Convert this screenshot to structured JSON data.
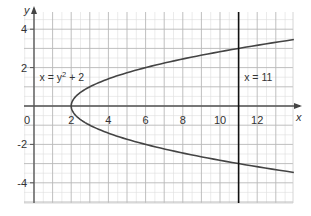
{
  "chart_data": {
    "type": "line",
    "title": "",
    "xlabel": "x",
    "ylabel": "y",
    "xlim": [
      -1,
      13.5
    ],
    "ylim": [
      -5,
      4.8
    ],
    "grid": true,
    "grid_minor_step": 0.5,
    "grid_major_step": 1,
    "x_ticks": [
      0,
      2,
      4,
      6,
      8,
      10,
      12
    ],
    "x_tick_labels": [
      "0",
      "2",
      "4",
      "6",
      "8",
      "10",
      "12"
    ],
    "y_ticks": [
      4,
      2,
      -2,
      -4
    ],
    "y_tick_labels": [
      "4",
      "2",
      "-2",
      "-4"
    ],
    "series": [
      {
        "name": "x = y² + 2",
        "equation": "x = y^2 + 2",
        "kind": "parametric-parabola",
        "y_range": [
          -3.46,
          3.46
        ],
        "points": [
          {
            "x": 14.0,
            "y": -3.46
          },
          {
            "x": 11.0,
            "y": -3.0
          },
          {
            "x": 8.25,
            "y": -2.5
          },
          {
            "x": 6.0,
            "y": -2.0
          },
          {
            "x": 4.25,
            "y": -1.5
          },
          {
            "x": 3.0,
            "y": -1.0
          },
          {
            "x": 2.25,
            "y": -0.5
          },
          {
            "x": 2.0,
            "y": 0.0
          },
          {
            "x": 2.25,
            "y": 0.5
          },
          {
            "x": 3.0,
            "y": 1.0
          },
          {
            "x": 4.25,
            "y": 1.5
          },
          {
            "x": 6.0,
            "y": 2.0
          },
          {
            "x": 8.25,
            "y": 2.5
          },
          {
            "x": 11.0,
            "y": 3.0
          },
          {
            "x": 14.0,
            "y": 3.46
          }
        ],
        "color": "#444444"
      },
      {
        "name": "x = 11",
        "equation": "x = 11",
        "kind": "vertical-line",
        "x": 11,
        "color": "#111111"
      }
    ],
    "annotations": [
      {
        "text_parts": [
          "x = y",
          "2",
          " + 2"
        ],
        "x": 0.3,
        "y": 1.3,
        "label": "x = y² + 2"
      },
      {
        "text_parts": [
          "x = 11"
        ],
        "x": 11.3,
        "y": 1.3,
        "label": "x = 11"
      }
    ],
    "origin_label": "0"
  }
}
